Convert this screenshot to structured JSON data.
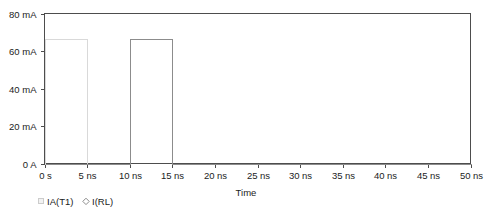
{
  "chart_data": {
    "type": "line",
    "title": "",
    "subtitle": "",
    "xlabel": "Time",
    "ylabel": "",
    "grid": false,
    "legend_position": "bottom-left",
    "xlim": [
      0,
      50
    ],
    "ylim": [
      0,
      80
    ],
    "x_unit": "ns",
    "y_unit": "mA",
    "xticks": [
      0,
      5,
      10,
      15,
      20,
      25,
      30,
      35,
      40,
      45,
      50
    ],
    "xtick_labels": [
      "0 s",
      "5 ns",
      "10 ns",
      "15 ns",
      "20 ns",
      "25 ns",
      "30 ns",
      "35 ns",
      "40 ns",
      "45 ns",
      "50 ns"
    ],
    "yticks": [
      0,
      20,
      40,
      60,
      80
    ],
    "ytick_labels": [
      "0 A",
      "20 mA",
      "40 mA",
      "60 mA",
      "80 mA"
    ],
    "series": [
      {
        "name": "IA(T1)",
        "marker": "square",
        "color": "#d9d9d9",
        "points": [
          {
            "x": 0,
            "y": 0
          },
          {
            "x": 0,
            "y": 66.5
          },
          {
            "x": 5,
            "y": 66.5
          },
          {
            "x": 5,
            "y": 0
          },
          {
            "x": 10,
            "y": 0
          },
          {
            "x": 10,
            "y": 66.5
          },
          {
            "x": 15,
            "y": 66.5
          },
          {
            "x": 15,
            "y": 0
          },
          {
            "x": 50,
            "y": 0
          }
        ]
      },
      {
        "name": "I(RL)",
        "marker": "diamond",
        "color": "#8c8c8c",
        "points": [
          {
            "x": 0,
            "y": 0
          },
          {
            "x": 10,
            "y": 0
          },
          {
            "x": 10,
            "y": 66.5
          },
          {
            "x": 15,
            "y": 66.5
          },
          {
            "x": 15,
            "y": 0
          },
          {
            "x": 50,
            "y": 0
          }
        ]
      }
    ],
    "pulse_high_value": 66.5,
    "pulse_low_value": 0
  },
  "legend": {
    "entries": [
      {
        "label": "IA(T1)",
        "marker": "square"
      },
      {
        "label": "I(RL)",
        "marker": "diamond"
      }
    ]
  },
  "axis": {
    "x_title": "Time",
    "y_title": ""
  },
  "colors": {
    "frame": "#4d4d4d",
    "series_a": "#d9d9d9",
    "series_b": "#8c8c8c",
    "text": "#1c1c1c",
    "background": "#ffffff"
  },
  "ticks": {
    "x": [
      {
        "value": 0,
        "label": "0 s",
        "px": 44
      },
      {
        "value": 5,
        "label": "5 ns",
        "px": 87
      },
      {
        "value": 10,
        "label": "10 ns",
        "px": 130
      },
      {
        "value": 15,
        "label": "15 ns",
        "px": 173
      },
      {
        "value": 20,
        "label": "20 ns",
        "px": 215
      },
      {
        "value": 25,
        "label": "25 ns",
        "px": 258
      },
      {
        "value": 30,
        "label": "30 ns",
        "px": 301
      },
      {
        "value": 35,
        "label": "35 ns",
        "px": 343
      },
      {
        "value": 40,
        "label": "40 ns",
        "px": 386
      },
      {
        "value": 45,
        "label": "45 ns",
        "px": 428
      },
      {
        "value": 50,
        "label": "50 ns",
        "px": 470
      }
    ],
    "y": [
      {
        "value": 80,
        "label": "80 mA",
        "px": 13
      },
      {
        "value": 60,
        "label": "60 mA",
        "px": 50
      },
      {
        "value": 40,
        "label": "40 mA",
        "px": 88
      },
      {
        "value": 20,
        "label": "20 mA",
        "px": 125
      },
      {
        "value": 0,
        "label": "0 A",
        "px": 163
      }
    ]
  }
}
